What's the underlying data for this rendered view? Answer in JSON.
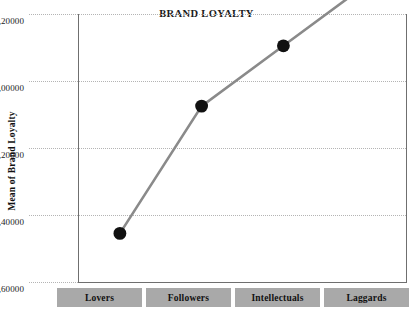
{
  "chart_data": {
    "type": "line",
    "title": "BRAND LOYALTY",
    "xlabel": "",
    "ylabel": "Mean of Brand Loyalty",
    "categories": [
      "Lovers",
      "Followers",
      "Intellectuals",
      "Laggards"
    ],
    "values": [
      -0.455,
      -0.075,
      0.105,
      0.285
    ],
    "ylim": [
      -0.6,
      0.2
    ],
    "ytick_values": [
      0.2,
      0.0,
      -0.2,
      -0.4,
      -0.6
    ],
    "ytick_labels": [
      "0,20000",
      "0,00000",
      "−0,20000",
      "−0,40000",
      "−0,60000"
    ],
    "decimal_separator": ",",
    "grid": true,
    "grid_style": "dotted",
    "legend": false,
    "marker": "filled-circle",
    "marker_color": "#111111",
    "line_color": "#8a8a8a",
    "grid_color": "#b4b4b4",
    "frame_color": "#6f6f6f",
    "category_box_color": "#a9a9a9",
    "series": [
      {
        "name": "Mean of Brand Loyalty",
        "points": [
          {
            "category": "Lovers",
            "value": -0.455
          },
          {
            "category": "Followers",
            "value": -0.075
          },
          {
            "category": "Intellectuals",
            "value": 0.105
          },
          {
            "category": "Laggards",
            "value": 0.285
          }
        ]
      }
    ]
  }
}
